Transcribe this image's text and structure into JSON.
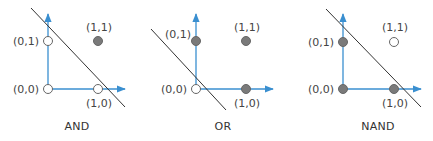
{
  "colors": {
    "axis": "#3a8fd0",
    "line": "#333333",
    "filled": "#7a7a7a",
    "hollow": "#ffffff",
    "point_stroke": "#666666"
  },
  "panels": [
    {
      "title": "AND",
      "points": [
        {
          "label": "(0,0)",
          "filled": false
        },
        {
          "label": "(0,1)",
          "filled": false
        },
        {
          "label": "(1,0)",
          "filled": false
        },
        {
          "label": "(1,1)",
          "filled": true
        }
      ]
    },
    {
      "title": "OR",
      "points": [
        {
          "label": "(0,0)",
          "filled": false
        },
        {
          "label": "(0,1)",
          "filled": true
        },
        {
          "label": "(1,0)",
          "filled": true
        },
        {
          "label": "(1,1)",
          "filled": true
        }
      ]
    },
    {
      "title": "NAND",
      "points": [
        {
          "label": "(0,0)",
          "filled": true
        },
        {
          "label": "(0,1)",
          "filled": true
        },
        {
          "label": "(1,0)",
          "filled": true
        },
        {
          "label": "(1,1)",
          "filled": false
        }
      ]
    }
  ]
}
